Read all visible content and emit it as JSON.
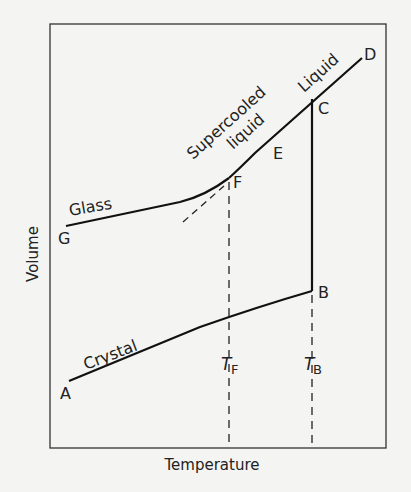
{
  "diagram": {
    "axes": {
      "x_label": "Temperature",
      "y_label": "Volume"
    },
    "curve_labels": {
      "glass": "Glass",
      "supercooled_1": "Supercooled",
      "supercooled_2": "liquid",
      "liquid": "Liquid",
      "crystal": "Crystal"
    },
    "points": {
      "A": "A",
      "B": "B",
      "C": "C",
      "D": "D",
      "E": "E",
      "F": "F",
      "G": "G"
    },
    "temperatures": {
      "tf_main": "T",
      "tf_sub": "F",
      "tb_main": "T",
      "tb_sub": "B"
    },
    "colors": {
      "ink": "#222222",
      "paper": "#f4f4f2"
    }
  }
}
